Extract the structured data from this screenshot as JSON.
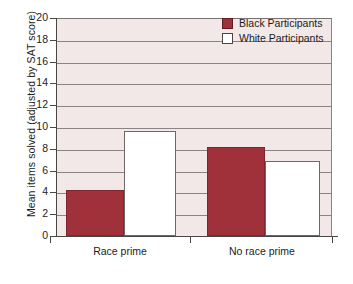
{
  "chart_data": {
    "type": "bar",
    "title": "",
    "subtitle": "",
    "xlabel": "",
    "ylabel": "Mean items solved (adjusted by SAT score)",
    "categories": [
      "Race prime",
      "No race prime"
    ],
    "series": [
      {
        "name": "Black Participants",
        "color": "#a0303a",
        "values": [
          4.2,
          8.2
        ]
      },
      {
        "name": "White Participants",
        "color": "#ffffff",
        "values": [
          9.6,
          6.9
        ]
      }
    ],
    "ylim": [
      0,
      20
    ],
    "ytick_step": 2,
    "yticks": [
      0,
      2,
      4,
      6,
      8,
      10,
      12,
      14,
      16,
      18,
      20
    ],
    "ytick_labels": [
      "0",
      "2",
      "4",
      "6",
      "8",
      "10",
      "12",
      "14",
      "16",
      "18",
      "20"
    ],
    "grid": true,
    "grid_axis": "y",
    "legend_position": "top-right",
    "plot_background": "#f3e8e8",
    "figure_background": "#ffffff",
    "gridline_color": "#8b8385",
    "axis_color": "#4a4547"
  },
  "legend": {
    "entries": [
      {
        "label": "Black Participants",
        "swatch": "black-swatch"
      },
      {
        "label": "White Participants",
        "swatch": "white-swatch"
      }
    ]
  },
  "axes": {
    "y_title": "Mean items solved (adjusted by SAT score)",
    "x_labels": [
      "Race prime",
      "No race prime"
    ]
  }
}
